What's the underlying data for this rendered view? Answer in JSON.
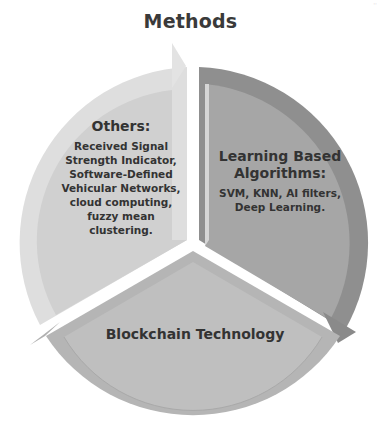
{
  "title": "Methods",
  "corner_mark": "··",
  "diagram": {
    "type": "cycle-pie",
    "segments": [
      {
        "id": "learning",
        "heading": "Learning Based Algorithms:",
        "heading_line1": "Learning Based",
        "heading_line2": "Algorithms:",
        "body_line1": "SVM, KNN, AI filters,",
        "body_line2": "Deep Learning.",
        "fill": "#a3a3a3",
        "arrow_color": "#8c8c8c"
      },
      {
        "id": "blockchain",
        "heading": "Blockchain Technology",
        "fill": "#bdbdbd",
        "arrow_color": "#b0b0b0"
      },
      {
        "id": "others",
        "heading": "Others:",
        "body_line1": "Received Signal",
        "body_line2": "Strength Indicator,",
        "body_line3": "Software-Defined",
        "body_line4": "Vehicular Networks,",
        "body_line5": "cloud computing,",
        "body_line6": "fuzzy mean",
        "body_line7": "clustering.",
        "fill": "#d2d2d2",
        "arrow_color": "#e0e0e0"
      }
    ]
  }
}
